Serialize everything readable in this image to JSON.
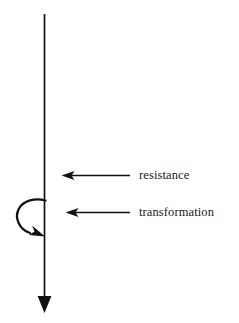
{
  "figure": {
    "type": "line-diagram",
    "background_color": "#ffffff",
    "stroke_color": "#111111",
    "width": 239,
    "height": 323
  },
  "axis": {
    "name": "vertical-time-axis",
    "orientation": "vertical",
    "direction": "downward",
    "x": 44.5,
    "y_start": 14,
    "y_end": 297,
    "stroke_width": 1.6,
    "arrowhead": {
      "shape": "solid-triangle",
      "points_to": "down",
      "tip_x": 44.5,
      "tip_y": 313,
      "half_width": 7,
      "length": 17
    }
  },
  "annotations": [
    {
      "id": "resistance",
      "label": "resistance",
      "arrow": {
        "name": "resistance-arrow",
        "direction": "left",
        "tail_x": 130,
        "tip_x": 62,
        "y": 175.5
      },
      "label_x": 139,
      "label_y": 169
    },
    {
      "id": "transformation",
      "label": "transformation",
      "arrow": {
        "name": "transformation-arrow",
        "direction": "left",
        "tail_x": 130,
        "tip_x": 66,
        "y": 212.5
      },
      "label_x": 139,
      "label_y": 206
    }
  ],
  "loop": {
    "name": "transformation-loop-arrow",
    "description": "curved loop leaving the axis, sweeping left and down, returning with arrowhead toward the axis",
    "start_x": 45,
    "start_y": 200,
    "end_x": 44,
    "end_y": 236,
    "extent_left_x": 17,
    "stroke_width": 2.2,
    "arrowhead": {
      "shape": "solid-barbed",
      "points_to": "down-right"
    }
  }
}
